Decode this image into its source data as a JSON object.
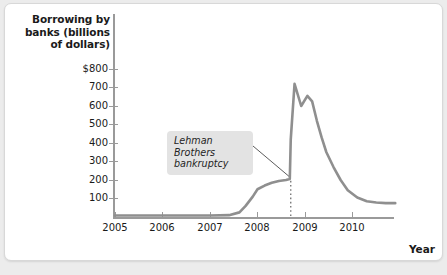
{
  "chart_data": {
    "type": "line",
    "title": "Borrowing by banks (billions of dollars)",
    "xlabel": "Year",
    "ylabel": "Borrowing by banks (billions of dollars)",
    "xlim": [
      2005.0,
      2010.9
    ],
    "ylim": [
      0,
      850
    ],
    "grid": false,
    "legend": null,
    "y_ticks": [
      "$800",
      "700",
      "600",
      "500",
      "400",
      "300",
      "200",
      "100"
    ],
    "y_tick_values": [
      800,
      700,
      600,
      500,
      400,
      300,
      200,
      100
    ],
    "x_ticks": [
      "2005",
      "2006",
      "2007",
      "2008",
      "2009",
      "2010"
    ],
    "x_tick_values": [
      2005,
      2006,
      2007,
      2008,
      2009,
      2010
    ],
    "series": [
      {
        "name": "Borrowing by banks",
        "color": "#8f8f8f",
        "x": [
          2005.0,
          2005.5,
          2006.0,
          2006.5,
          2007.0,
          2007.4,
          2007.62,
          2007.75,
          2007.9,
          2008.0,
          2008.15,
          2008.3,
          2008.45,
          2008.6,
          2008.68,
          2008.7,
          2008.78,
          2008.92,
          2009.05,
          2009.15,
          2009.25,
          2009.35,
          2009.45,
          2009.6,
          2009.75,
          2009.9,
          2010.1,
          2010.3,
          2010.5,
          2010.7,
          2010.9
        ],
        "y": [
          8,
          8,
          8,
          8,
          8,
          10,
          25,
          60,
          110,
          150,
          170,
          185,
          195,
          200,
          205,
          420,
          720,
          600,
          655,
          625,
          520,
          430,
          350,
          270,
          200,
          145,
          105,
          85,
          78,
          75,
          75
        ]
      }
    ],
    "annotations": [
      {
        "name": "lehman-brothers-bankruptcy",
        "text_line1": "Lehman Brothers",
        "text_line2": "bankruptcy",
        "event_x": 2008.7,
        "marker": "dotted-vertical-line",
        "leader_line": true
      }
    ]
  },
  "figure": {
    "y_axis_title": "Borrowing by banks (billions of dollars)",
    "y_axis_title_line1": "Borrowing by",
    "y_axis_title_line2": "banks (billions",
    "y_axis_title_line3": "of dollars)",
    "x_axis_title": "Year"
  },
  "colors": {
    "line": "#8f8f8f",
    "axis": "#9a9a9a",
    "text": "#1a1a1a",
    "callout_background": "#e3e3e3",
    "page_background": "#ececec",
    "card_background": "#ffffff"
  }
}
